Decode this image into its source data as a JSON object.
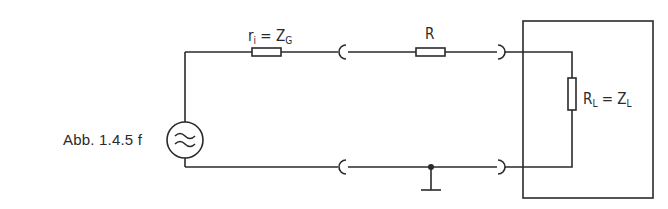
{
  "figure": {
    "caption": "Abb. 1.4.5 f",
    "labels": {
      "source_resistor": {
        "main": "r",
        "sub": "i",
        "eq": " = Z",
        "eq_sub": "G"
      },
      "line_resistor": "R",
      "load_resistor": {
        "main": "R",
        "sub": "L",
        "eq": " = Z",
        "eq_sub": "L"
      }
    },
    "components": [
      {
        "type": "ac-source",
        "symbol": "≈"
      },
      {
        "type": "resistor",
        "name": "source-internal-resistance"
      },
      {
        "type": "connector",
        "name": "coax-connector-left-top"
      },
      {
        "type": "resistor",
        "name": "line-resistance"
      },
      {
        "type": "connector",
        "name": "coax-connector-right-top"
      },
      {
        "type": "resistor",
        "name": "load-resistance"
      },
      {
        "type": "connector",
        "name": "coax-connector-left-bottom"
      },
      {
        "type": "ground",
        "name": "ground"
      },
      {
        "type": "connector",
        "name": "coax-connector-right-bottom"
      },
      {
        "type": "enclosure",
        "name": "load-enclosure"
      }
    ],
    "colors": {
      "ink": "#2a2a2a",
      "background": "#ffffff"
    }
  }
}
